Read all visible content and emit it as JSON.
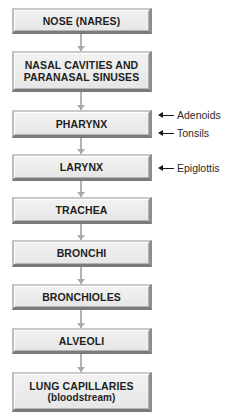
{
  "diagram": {
    "nodes": [
      {
        "id": "nose",
        "label": "NOSE (NARES)",
        "sub": ""
      },
      {
        "id": "nasal",
        "label": "NASAL CAVITIES AND PARANASAL SINUSES",
        "sub": ""
      },
      {
        "id": "pharynx",
        "label": "PHARYNX",
        "sub": ""
      },
      {
        "id": "larynx",
        "label": "LARYNX",
        "sub": ""
      },
      {
        "id": "trachea",
        "label": "TRACHEA",
        "sub": ""
      },
      {
        "id": "bronchi",
        "label": "BRONCHI",
        "sub": ""
      },
      {
        "id": "bronchioles",
        "label": "BRONCHIOLES",
        "sub": ""
      },
      {
        "id": "alveoli",
        "label": "ALVEOLI",
        "sub": ""
      },
      {
        "id": "capillaries",
        "label": "LUNG CAPILLARIES",
        "sub": "(bloodstream)"
      }
    ],
    "nasal_lines": [
      "NASAL CAVITIES AND",
      "PARANASAL SINUSES"
    ],
    "annotations": [
      {
        "target": "pharynx",
        "label": "Adenoids"
      },
      {
        "target": "pharynx",
        "label": "Tonsils"
      },
      {
        "target": "larynx",
        "label": "Epiglottis"
      }
    ],
    "colors": {
      "box_fill": "#ececec",
      "box_border_dark": "#7a7a7a",
      "connector": "#b3b3b3",
      "text": "#1e1e1e"
    }
  }
}
